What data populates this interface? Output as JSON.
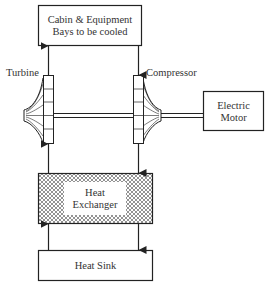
{
  "diagram": {
    "type": "air-cycle cooling system schematic",
    "nodes": {
      "cabin": {
        "line1": "Cabin & Equipment",
        "line2": "Bays to be cooled"
      },
      "turbine": {
        "label": "Turbine"
      },
      "compressor": {
        "label": "Compressor"
      },
      "motor": {
        "line1": "Electric",
        "line2": "Motor"
      },
      "heat_exchanger": {
        "line1": "Heat",
        "line2": "Exchanger"
      },
      "heat_sink": {
        "label": "Heat Sink"
      }
    },
    "edges": [
      {
        "from": "turbine",
        "to": "cabin",
        "direction": "up"
      },
      {
        "from": "cabin",
        "to": "compressor",
        "direction": "down"
      },
      {
        "from": "compressor",
        "to": "heat_exchanger",
        "direction": "down"
      },
      {
        "from": "heat_exchanger",
        "to": "turbine",
        "direction": "up"
      },
      {
        "from": "heat_exchanger",
        "to": "heat_sink",
        "direction": "down"
      },
      {
        "from": "heat_sink",
        "to": "heat_exchanger",
        "direction": "up"
      },
      {
        "from": "motor",
        "to": "compressor",
        "type": "shaft"
      },
      {
        "from": "compressor",
        "to": "turbine",
        "type": "shaft"
      }
    ],
    "colors": {
      "stroke": "#222222",
      "background": "#ffffff",
      "hatch": "#555555"
    }
  }
}
